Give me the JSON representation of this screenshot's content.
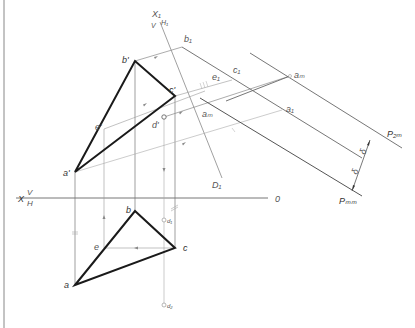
{
  "drawing": {
    "type": "descriptive-geometry-construction",
    "axes": {
      "main_axis": {
        "left_label": "X",
        "upper_plane": "V",
        "lower_plane": "H",
        "right_label": "0"
      },
      "aux_axis": {
        "top_label": "X₁",
        "left_plane": "V",
        "right_plane": "H₁",
        "end_label": "D₁"
      }
    },
    "frontal_projection": {
      "points": [
        {
          "name": "a'",
          "x": 75,
          "y": 172
        },
        {
          "name": "b'",
          "x": 135,
          "y": 61
        },
        {
          "name": "c'",
          "x": 175,
          "y": 96
        },
        {
          "name": "e'",
          "x": 104,
          "y": 129
        },
        {
          "name": "d'",
          "x": 164,
          "y": 117
        }
      ]
    },
    "horizontal_projection": {
      "points": [
        {
          "name": "a",
          "x": 75,
          "y": 285
        },
        {
          "name": "b",
          "x": 135,
          "y": 211
        },
        {
          "name": "c",
          "x": 175,
          "y": 248
        },
        {
          "name": "e",
          "x": 104,
          "y": 248
        },
        {
          "name": "d₁",
          "x": 164,
          "y": 220
        },
        {
          "name": "d₂",
          "x": 164,
          "y": 305
        }
      ]
    },
    "auxiliary_projection": {
      "labels": [
        "b₁",
        "e₁",
        "c₁",
        "a₁",
        "aₘ",
        "aₘ",
        "a₁"
      ]
    },
    "planes": {
      "upper": "P₂ₘ",
      "lower": "Pₘₘ"
    },
    "dimension_marks": [
      "δ",
      "δ"
    ]
  }
}
